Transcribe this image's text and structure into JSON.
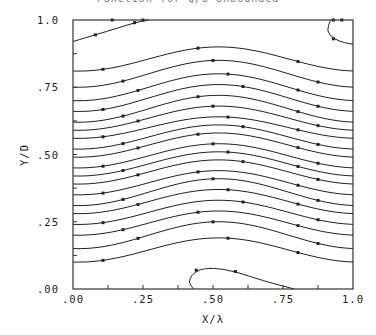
{
  "title": "Function for Q/U=Unbounded",
  "chart_data": {
    "type": "line",
    "title": "Function for Q/U=Unbounded",
    "xlabel": "X/λ",
    "ylabel": "Y/D",
    "xlim": [
      0,
      1
    ],
    "ylim": [
      0,
      1
    ],
    "x_ticks": [
      ".00",
      ".25",
      ".50",
      ".75",
      "1.0"
    ],
    "y_ticks": [
      ".00",
      ".25",
      ".50",
      ".75",
      "1.0"
    ],
    "x_tick_values": [
      0,
      0.25,
      0.5,
      0.75,
      1.0
    ],
    "y_tick_values": [
      0,
      0.25,
      0.5,
      0.75,
      1.0
    ],
    "minor_tick_step": 0.125,
    "grid": false,
    "legend": null,
    "streamlines": [
      {
        "y_edge": 0.81,
        "y_center": 0.9
      },
      {
        "y_edge": 0.75,
        "y_center": 0.85
      },
      {
        "y_edge": 0.7,
        "y_center": 0.8
      },
      {
        "y_edge": 0.66,
        "y_center": 0.76
      },
      {
        "y_edge": 0.62,
        "y_center": 0.72
      },
      {
        "y_edge": 0.59,
        "y_center": 0.68
      },
      {
        "y_edge": 0.56,
        "y_center": 0.64
      },
      {
        "y_edge": 0.52,
        "y_center": 0.61
      },
      {
        "y_edge": 0.49,
        "y_center": 0.58
      },
      {
        "y_edge": 0.45,
        "y_center": 0.54
      },
      {
        "y_edge": 0.42,
        "y_center": 0.51
      },
      {
        "y_edge": 0.39,
        "y_center": 0.48
      },
      {
        "y_edge": 0.35,
        "y_center": 0.44
      },
      {
        "y_edge": 0.31,
        "y_center": 0.41
      },
      {
        "y_edge": 0.28,
        "y_center": 0.37
      },
      {
        "y_edge": 0.24,
        "y_center": 0.33
      },
      {
        "y_edge": 0.2,
        "y_center": 0.29
      },
      {
        "y_edge": 0.15,
        "y_center": 0.25
      },
      {
        "y_edge": 0.1,
        "y_center": 0.19
      }
    ],
    "top_streamline": {
      "points": [
        [
          0,
          0.92
        ],
        [
          0.08,
          0.945
        ],
        [
          0.16,
          0.97
        ],
        [
          0.22,
          0.99
        ],
        [
          0.27,
          1.0
        ]
      ]
    },
    "bubbles": [
      {
        "name": "bottom-recirculation",
        "points": [
          [
            0.43,
            0.0
          ],
          [
            0.41,
            0.03
          ],
          [
            0.44,
            0.07
          ],
          [
            0.5,
            0.08
          ],
          [
            0.58,
            0.065
          ],
          [
            0.68,
            0.03
          ],
          [
            0.79,
            0.0
          ]
        ]
      },
      {
        "name": "top-right-recirculation",
        "points": [
          [
            0.92,
            1.0
          ],
          [
            0.905,
            0.96
          ],
          [
            0.93,
            0.93
          ],
          [
            0.97,
            0.915
          ],
          [
            1.0,
            0.91
          ]
        ]
      }
    ]
  }
}
